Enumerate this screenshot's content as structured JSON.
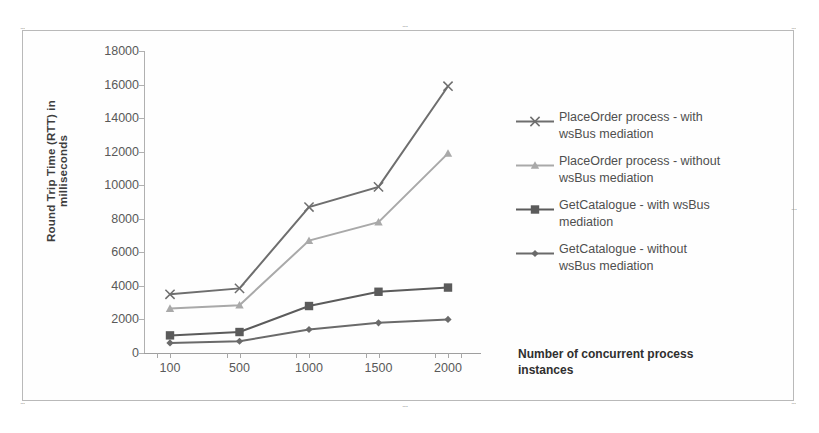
{
  "chart_data": {
    "type": "line",
    "title": "",
    "xlabel": "Number of concurrent process instances",
    "ylabel": "Round Trip Time (RTT) in milliseconds",
    "categories": [
      "100",
      "500",
      "1000",
      "1500",
      "2000"
    ],
    "x": [
      100,
      500,
      1000,
      1500,
      2000
    ],
    "ylim": [
      0,
      18000
    ],
    "ytick_step": 2000,
    "yticks": [
      "18000",
      "16000",
      "14000",
      "12000",
      "10000",
      "8000",
      "6000",
      "4000",
      "2000",
      "0"
    ],
    "grid": false,
    "legend_position": "right",
    "series": [
      {
        "name": "PlaceOrder process - with wsBus mediation",
        "marker": "x-cross",
        "color": "#6e6e6e",
        "values": [
          3500,
          3850,
          8700,
          9900,
          15900
        ]
      },
      {
        "name": "PlaceOrder process - without wsBus mediation",
        "marker": "triangle",
        "color": "#a9a9a9",
        "values": [
          2650,
          2850,
          6700,
          7800,
          11900
        ]
      },
      {
        "name": "GetCatalogue  - with wsBus mediation",
        "marker": "square",
        "color": "#5b5b5b",
        "values": [
          1050,
          1250,
          2800,
          3650,
          3900
        ]
      },
      {
        "name": "GetCatalogue  - without wsBus mediation",
        "marker": "diamond",
        "color": "#6a6a6a",
        "values": [
          600,
          700,
          1400,
          1800,
          2000
        ]
      }
    ]
  },
  "legend": {
    "items": [
      {
        "line1": "PlaceOrder process - with",
        "line2": "wsBus mediation"
      },
      {
        "line1": "PlaceOrder process - without",
        "line2": "wsBus mediation"
      },
      {
        "line1": "GetCatalogue  - with wsBus",
        "line2": "mediation"
      },
      {
        "line1": "GetCatalogue  - without",
        "line2": "wsBus mediation"
      }
    ]
  },
  "frame": {
    "handle_glyph": "····"
  }
}
